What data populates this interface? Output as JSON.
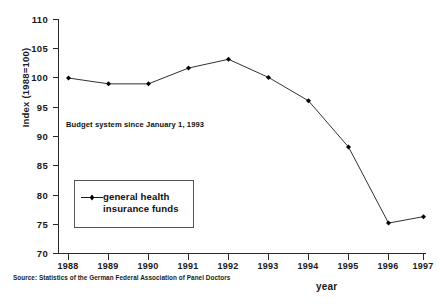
{
  "chart_data": {
    "type": "line",
    "title": "",
    "xlabel": "year",
    "ylabel": "Index (1988=100)",
    "categories": [
      "1988",
      "1989",
      "1990",
      "1991",
      "1992",
      "1993",
      "1994",
      "1995",
      "1996",
      "1997"
    ],
    "series": [
      {
        "name": "general health\ninsurance funds",
        "values": [
          100.0,
          99.0,
          99.0,
          101.7,
          103.2,
          100.1,
          96.1,
          88.2,
          75.2,
          76.3
        ]
      }
    ],
    "ylim": [
      70,
      110
    ],
    "ytick_values": [
      70,
      75,
      80,
      85,
      90,
      95,
      100,
      105,
      110
    ],
    "ytick_labels": [
      "70",
      "75",
      "80",
      "85",
      "90",
      "95",
      "100",
      "105",
      "110"
    ],
    "grid": false,
    "legend_position": "inside-left",
    "annotations": [
      {
        "text": "Budget system since January 1, 1993",
        "x": "1989",
        "y": 90.5
      }
    ],
    "source_note": "Source: Statistics of the German Federal Association of Panel Doctors",
    "marker": "filled-diamond",
    "line_color": "#1a1a1a",
    "marker_color": "#000000"
  },
  "legend": {
    "entries": [
      {
        "label": "general health\ninsurance funds",
        "color": "#1a1a1a"
      }
    ]
  },
  "axes": {
    "y_label": "Index (1988=100)",
    "x_label": "year"
  }
}
